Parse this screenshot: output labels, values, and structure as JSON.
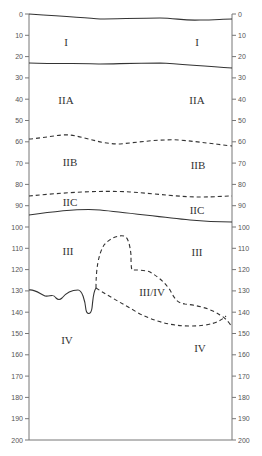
{
  "diagram": {
    "type": "soil-profile",
    "axis": {
      "min": 0,
      "max": 200,
      "step": 10,
      "ticks": [
        "0",
        "10",
        "20",
        "30",
        "40",
        "50",
        "60",
        "70",
        "80",
        "90",
        "100",
        "110",
        "120",
        "130",
        "140",
        "150",
        "160",
        "170",
        "180",
        "190",
        "200"
      ]
    },
    "zones": [
      {
        "id": "I",
        "label_left": "I",
        "label_right": "I"
      },
      {
        "id": "IIA",
        "label_left": "IIA",
        "label_right": "IIA"
      },
      {
        "id": "IIB",
        "label_left": "IIB",
        "label_right": "IIB"
      },
      {
        "id": "IIC",
        "label_left": "IIC",
        "label_right": "IIC"
      },
      {
        "id": "III",
        "label_left": "III",
        "label_right": "III"
      },
      {
        "id": "III/IV",
        "label": "III/IV"
      },
      {
        "id": "IV",
        "label_left": "IV",
        "label_right": "IV"
      }
    ],
    "boundaries": [
      {
        "between": "surface",
        "style": "solid",
        "depth_left": 0,
        "depth_right": 3
      },
      {
        "between": "I-IIA",
        "style": "solid",
        "depth_left": 23,
        "depth_right": 25
      },
      {
        "between": "IIA-IIB",
        "style": "dashed",
        "depth_left": 58,
        "depth_right": 62
      },
      {
        "between": "IIB-IIC",
        "style": "dashed",
        "depth_left": 85,
        "depth_right": 86
      },
      {
        "between": "IIC-III",
        "style": "solid",
        "depth_left": 94,
        "depth_right": 97
      },
      {
        "between": "III-IV",
        "style": "solid",
        "depth_left": 130,
        "depth_right": 137
      },
      {
        "between": "III/IV transition",
        "style": "dashed",
        "depth_range": [
          106,
          146
        ]
      }
    ],
    "colors": {
      "line": "#333333",
      "axis": "#666666",
      "text": "#333333"
    }
  }
}
